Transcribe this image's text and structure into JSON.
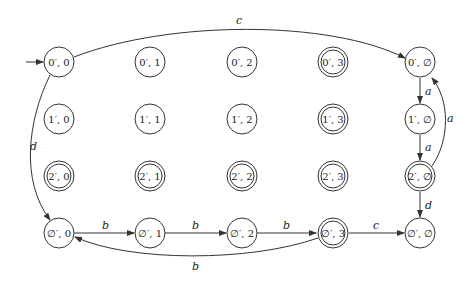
{
  "diagram": {
    "type": "finite-automaton",
    "nodes": [
      {
        "id": "n00",
        "label": "0′, 0",
        "accepting": false,
        "initial": true
      },
      {
        "id": "n01",
        "label": "0′, 1",
        "accepting": false
      },
      {
        "id": "n02",
        "label": "0′, 2",
        "accepting": false
      },
      {
        "id": "n03",
        "label": "0′, 3",
        "accepting": true
      },
      {
        "id": "n0e",
        "label": "0′, ∅",
        "accepting": false
      },
      {
        "id": "n10",
        "label": "1′, 0",
        "accepting": false
      },
      {
        "id": "n11",
        "label": "1′, 1",
        "accepting": false
      },
      {
        "id": "n12",
        "label": "1′, 2",
        "accepting": false
      },
      {
        "id": "n13",
        "label": "1′, 3",
        "accepting": true
      },
      {
        "id": "n1e",
        "label": "1′, ∅",
        "accepting": false
      },
      {
        "id": "n20",
        "label": "2′, 0",
        "accepting": true
      },
      {
        "id": "n21",
        "label": "2′, 1",
        "accepting": true
      },
      {
        "id": "n22",
        "label": "2′, 2",
        "accepting": true
      },
      {
        "id": "n23",
        "label": "2′, 3",
        "accepting": true
      },
      {
        "id": "n2e",
        "label": "2′, ∅",
        "accepting": true
      },
      {
        "id": "ne0",
        "label": "∅′, 0",
        "accepting": false
      },
      {
        "id": "ne1",
        "label": "∅′, 1",
        "accepting": false
      },
      {
        "id": "ne2",
        "label": "∅′, 2",
        "accepting": false
      },
      {
        "id": "ne3",
        "label": "∅′, 3",
        "accepting": true
      },
      {
        "id": "nee",
        "label": "∅′, ∅",
        "accepting": false
      }
    ],
    "edges": [
      {
        "from": "n00",
        "to": "n0e",
        "label": "c"
      },
      {
        "from": "n00",
        "to": "ne0",
        "label": "d"
      },
      {
        "from": "n0e",
        "to": "n1e",
        "label": "a"
      },
      {
        "from": "n1e",
        "to": "n2e",
        "label": "a"
      },
      {
        "from": "n2e",
        "to": "n0e",
        "label": "a"
      },
      {
        "from": "n2e",
        "to": "nee",
        "label": "d"
      },
      {
        "from": "ne0",
        "to": "ne1",
        "label": "b"
      },
      {
        "from": "ne1",
        "to": "ne2",
        "label": "b"
      },
      {
        "from": "ne2",
        "to": "ne3",
        "label": "b"
      },
      {
        "from": "ne3",
        "to": "ne0",
        "label": "b"
      },
      {
        "from": "ne3",
        "to": "nee",
        "label": "c"
      }
    ]
  }
}
